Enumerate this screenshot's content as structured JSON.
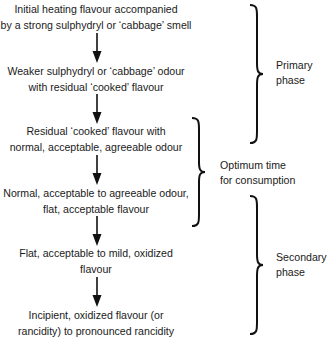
{
  "diagram": {
    "type": "flowchart-with-brackets",
    "steps": [
      {
        "line1": "Initial heating flavour accompanied",
        "line2": "by a strong sulphydryl or ‘cabbage’ smell"
      },
      {
        "line1": "Weaker sulphydryl or ‘cabbage’ odour",
        "line2": "with residual ‘cooked’ flavour"
      },
      {
        "line1": "Residual ‘cooked’ flavour with",
        "line2": "normal, acceptable, agreeable odour"
      },
      {
        "line1": "Normal, acceptable to agreeable odour,",
        "line2": "flat, acceptable flavour"
      },
      {
        "line1": "Flat, acceptable to mild, oxidized",
        "line2": "flavour"
      },
      {
        "line1": "Incipient, oxidized flavour (or",
        "line2": "rancidity) to pronounced rancidity"
      }
    ],
    "phases": [
      {
        "line1": "Primary",
        "line2": "phase",
        "spans_steps": [
          1,
          2
        ]
      },
      {
        "line1": "Optimum time",
        "line2": "for consumption",
        "spans_steps": [
          3,
          4
        ]
      },
      {
        "line1": "Secondary",
        "line2": "phase",
        "spans_steps": [
          5,
          6
        ]
      }
    ],
    "colors": {
      "text": "#1a1a1a",
      "lines": "#111111",
      "background": "#ffffff"
    }
  }
}
